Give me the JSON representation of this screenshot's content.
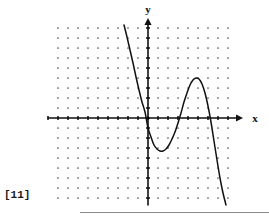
{
  "figure": {
    "number_label": "[11]",
    "background_color": "#ffffff",
    "ink_color": "#111111",
    "grid_dot_color": "#555555",
    "rule_color": "#8c8c8c"
  },
  "axes": {
    "x_axis_label": "x",
    "y_axis_label": "y",
    "x_arrow_icon": "arrow-right-icon",
    "y_arrow_icon": "arrow-up-icon",
    "origin_px": [
      148,
      118
    ],
    "x_axis_span_px": [
      48,
      243
    ],
    "y_axis_span_px": [
      18,
      205
    ],
    "tick_spacing_px": 10,
    "tick_length_px": 4
  },
  "grid": {
    "left_px": 58,
    "top_px": 28,
    "right_px": 232,
    "bottom_px": 198,
    "spacing_px": 10,
    "dot_radius_px": 0.85
  },
  "chart_data": {
    "type": "line",
    "title": "",
    "subtitle": "",
    "xlabel": "x",
    "ylabel": "y",
    "grid": true,
    "legend": false,
    "legend_entries": [],
    "annotations": [
      "[11]"
    ],
    "xlim": [
      -9,
      8.4
    ],
    "ylim": [
      -8,
      9
    ],
    "axis_ticks_every": 1,
    "features": {
      "x_intercepts": [
        -0.5,
        3.1,
        6.2
      ],
      "local_minimum": [
        1.2,
        -3.2
      ],
      "local_maximum": [
        4.7,
        4.0
      ],
      "y_intercept": -2.1
    },
    "curve_points_px": [
      [
        124,
        25
      ],
      [
        127,
        37
      ],
      [
        130,
        50
      ],
      [
        133,
        63
      ],
      [
        136,
        77
      ],
      [
        139,
        90
      ],
      [
        142,
        102
      ],
      [
        145,
        112
      ],
      [
        148,
        128
      ],
      [
        151,
        137
      ],
      [
        154,
        145
      ],
      [
        157,
        149
      ],
      [
        160,
        151
      ],
      [
        163,
        151
      ],
      [
        166,
        149
      ],
      [
        169,
        145
      ],
      [
        172,
        139
      ],
      [
        175,
        132
      ],
      [
        178,
        123
      ],
      [
        181,
        113
      ],
      [
        184,
        102
      ],
      [
        187,
        93
      ],
      [
        190,
        85
      ],
      [
        193,
        80
      ],
      [
        196,
        78
      ],
      [
        199,
        79
      ],
      [
        202,
        84
      ],
      [
        205,
        93
      ],
      [
        208,
        106
      ],
      [
        211,
        122
      ],
      [
        214,
        141
      ],
      [
        217,
        160
      ],
      [
        220,
        178
      ],
      [
        223,
        193
      ],
      [
        226,
        205
      ]
    ]
  }
}
